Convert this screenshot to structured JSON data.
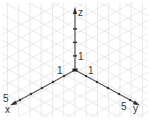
{
  "diagram": {
    "type": "isometric-3d-axes",
    "origin": [
      75,
      70
    ],
    "colors": {
      "grid": "#dcdcdc",
      "axis": "#555555",
      "text": "#333333",
      "background": "#ffffff"
    },
    "axes": {
      "x": {
        "label": "x",
        "tick_label_first": "1",
        "tick_label_last": "5",
        "ticks": 5
      },
      "y": {
        "label": "y",
        "tick_label_first": "1",
        "tick_label_last": "5",
        "ticks": 5
      },
      "z": {
        "label": "z",
        "tick_label_first": "1",
        "ticks": 4
      }
    }
  }
}
